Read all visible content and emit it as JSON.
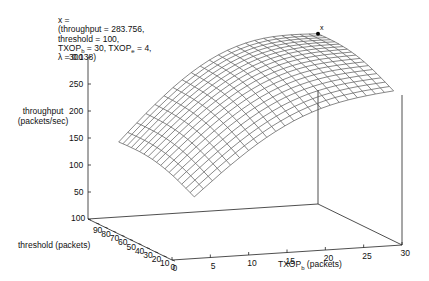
{
  "chart_data": {
    "type": "surface",
    "title": "",
    "annotation": {
      "marker": "x",
      "line1": "x =",
      "line2": "(throughput = 283.756,",
      "line3": "threshold = 100,",
      "line4_prefix": "TXOP",
      "line4_sub_b": "b",
      "line4_mid": " = 30, TXOP",
      "line4_sub_e": "e",
      "line4_suffix": " = 4,",
      "line5": "λ = 0.138)",
      "point": {
        "throughput": 283.756,
        "threshold": 100,
        "TXOP_b": 30,
        "TXOP_e": 4,
        "lambda": 0.138
      }
    },
    "zlabel_line1": "throughput",
    "zlabel_line2": "(packets/sec)",
    "xlabel_prefix": "TXOP",
    "xlabel_sub": "b",
    "xlabel_suffix": " (packets)",
    "ylabel": "threshold (packets)",
    "z_ticks": [
      "300",
      "250",
      "200",
      "150",
      "100",
      "50"
    ],
    "z_tick_values": [
      300,
      250,
      200,
      150,
      100,
      50
    ],
    "x_ticks": [
      "0",
      "5",
      "10",
      "15",
      "20",
      "25",
      "30"
    ],
    "x_tick_values": [
      0,
      5,
      10,
      15,
      20,
      25,
      30
    ],
    "y_ticks": [
      "100",
      "90",
      "80",
      "70",
      "60",
      "50",
      "40",
      "30",
      "20",
      "10",
      "0"
    ],
    "y_tick_values": [
      100,
      90,
      80,
      70,
      60,
      50,
      40,
      30,
      20,
      10,
      0
    ],
    "xlim": [
      0,
      30
    ],
    "ylim": [
      0,
      100
    ],
    "zlim": [
      0,
      300
    ],
    "grid": false,
    "surface": {
      "TXOP_b_range": [
        4,
        30
      ],
      "threshold_range": [
        10,
        100
      ],
      "grid_steps_TXOP": 22,
      "grid_steps_threshold": 18,
      "corners": {
        "TXOP4_thr10": 95,
        "TXOP4_thr100": 125,
        "TXOP30_thr10": 250,
        "TXOP30_thr100": 283.756
      },
      "line_color": "#555555"
    },
    "axis_color": "#222222",
    "marker_color": "#000000"
  }
}
